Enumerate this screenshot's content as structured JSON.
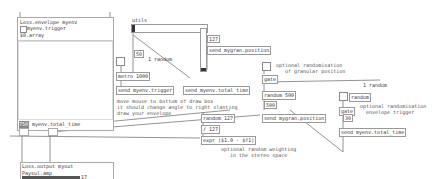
{
  "envelope_subpatch": {
    "title": "Loss.envelope myenv",
    "trigger_label": "myenv.trigger",
    "array_label": "$0.array",
    "total_time_value": "750",
    "total_time_label": "myenv.total_time"
  },
  "objects": {
    "utils": "utils",
    "metro": "metro 1000",
    "send_trigger": "send myenv.trigger",
    "send_total_time": "send myenv.total_time",
    "send_position": "send mygran.position",
    "random_a": "random",
    "num_a": "127",
    "num_b": "50",
    "gate_a": "gate",
    "random_500": "random 500",
    "num_500": "500",
    "send_position_2": "send mygran.position",
    "random_127": "random 127",
    "div_127": "/ 127",
    "expr": "expr ($1.0 - $f1)",
    "random_b": "random",
    "gate_b": "gate",
    "num_30": "30",
    "send_total_time_2": "send myenv.total_time",
    "random_label": "1 random"
  },
  "comments": {
    "granular": "optional randomisation\n   of granular position",
    "envelope": "optional randomisation\n  envelope trigger",
    "draw": "move mouse to bottom of draw box\nit should change angle to right slanting\ndraw your envelope",
    "stereo": "optional random weighting\n   in the stereo space"
  },
  "output_subpatch": {
    "title": "Loss.output myout",
    "amp_label": "Paysul.amp",
    "value": "17"
  }
}
